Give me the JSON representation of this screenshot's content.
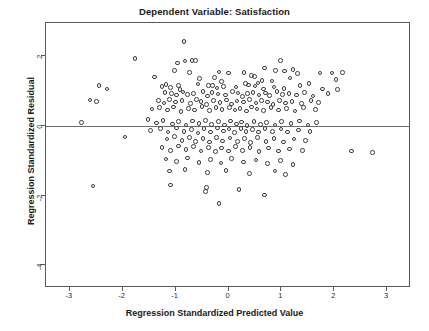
{
  "chart_data": {
    "type": "scatter",
    "title": "Dependent Variable: Satisfaction",
    "xlabel": "Regression Standardized Predicted Value",
    "ylabel": "Regression Standardized Residual",
    "xlim": [
      -3.45,
      3.45
    ],
    "ylim": [
      -4.65,
      2.95
    ],
    "xticks": [
      -3,
      -2,
      -1,
      0,
      1,
      2,
      3
    ],
    "xticklabels": [
      "-3",
      "-2",
      "-1",
      "0",
      "1",
      "2",
      "3"
    ],
    "yticks": [
      2,
      0,
      -2,
      -4
    ],
    "yticklabels": [
      "2",
      "0",
      "-2",
      "-4"
    ],
    "grid": false,
    "legend": null,
    "marker": "open-circle",
    "marker_color": "#3c3c3c",
    "frame_color": "#5a5a5a",
    "reference_lines": [
      {
        "orientation": "horizontal",
        "value": 0,
        "color": "#6e6e6e"
      }
    ],
    "n_points": 232,
    "points": [
      [
        -0.84,
        2.42
      ],
      [
        -1.77,
        1.93
      ],
      [
        -0.96,
        1.8
      ],
      [
        -0.82,
        1.86
      ],
      [
        -0.69,
        1.87
      ],
      [
        -0.62,
        1.88
      ],
      [
        0.98,
        1.87
      ],
      [
        -1.02,
        1.58
      ],
      [
        -0.74,
        1.53
      ],
      [
        -0.18,
        1.55
      ],
      [
        0.0,
        1.52
      ],
      [
        0.29,
        1.53
      ],
      [
        0.68,
        1.66
      ],
      [
        0.89,
        1.59
      ],
      [
        1.06,
        1.57
      ],
      [
        1.22,
        1.61
      ],
      [
        1.3,
        1.5
      ],
      [
        1.73,
        1.52
      ],
      [
        1.96,
        1.52
      ],
      [
        2.15,
        1.53
      ],
      [
        -1.4,
        1.4
      ],
      [
        -0.55,
        1.35
      ],
      [
        -0.26,
        1.39
      ],
      [
        -0.13,
        1.28
      ],
      [
        0.44,
        1.44
      ],
      [
        0.49,
        1.41
      ],
      [
        0.63,
        1.3
      ],
      [
        0.82,
        1.29
      ],
      [
        1.16,
        1.37
      ],
      [
        2.03,
        1.33
      ],
      [
        -2.45,
        1.15
      ],
      [
        -2.3,
        1.06
      ],
      [
        -1.26,
        1.13
      ],
      [
        -1.18,
        1.18
      ],
      [
        -1.1,
        1.1
      ],
      [
        -0.95,
        1.16
      ],
      [
        -0.92,
        1.05
      ],
      [
        -0.58,
        1.2
      ],
      [
        -0.38,
        1.16
      ],
      [
        -0.3,
        1.15
      ],
      [
        -0.22,
        1.09
      ],
      [
        -0.09,
        1.13
      ],
      [
        0.14,
        1.12
      ],
      [
        0.32,
        1.21
      ],
      [
        0.38,
        1.17
      ],
      [
        0.5,
        1.14
      ],
      [
        0.56,
        1.23
      ],
      [
        0.66,
        1.06
      ],
      [
        0.86,
        1.12
      ],
      [
        1.05,
        1.08
      ],
      [
        1.35,
        1.16
      ],
      [
        1.52,
        1.22
      ],
      [
        1.78,
        1.06
      ],
      [
        2.06,
        1.05
      ],
      [
        -1.2,
        0.95
      ],
      [
        -1.08,
        0.92
      ],
      [
        -0.98,
        0.88
      ],
      [
        -0.86,
        0.97
      ],
      [
        -0.78,
        0.9
      ],
      [
        -0.66,
        0.93
      ],
      [
        -0.48,
        0.98
      ],
      [
        -0.4,
        0.86
      ],
      [
        -0.31,
        0.96
      ],
      [
        -0.2,
        0.91
      ],
      [
        -0.06,
        0.88
      ],
      [
        0.08,
        0.99
      ],
      [
        0.18,
        0.94
      ],
      [
        0.26,
        0.85
      ],
      [
        0.36,
        0.92
      ],
      [
        0.46,
        0.96
      ],
      [
        0.58,
        0.89
      ],
      [
        0.7,
        0.94
      ],
      [
        0.78,
        0.87
      ],
      [
        0.92,
        0.98
      ],
      [
        1.02,
        0.9
      ],
      [
        1.14,
        0.93
      ],
      [
        1.28,
        0.88
      ],
      [
        1.44,
        0.95
      ],
      [
        1.6,
        0.86
      ],
      [
        1.88,
        0.92
      ],
      [
        -2.62,
        0.74
      ],
      [
        -2.5,
        0.7
      ],
      [
        -1.32,
        0.72
      ],
      [
        -1.22,
        0.66
      ],
      [
        -1.12,
        0.75
      ],
      [
        -1.0,
        0.68
      ],
      [
        -0.88,
        0.73
      ],
      [
        -0.72,
        0.64
      ],
      [
        -0.6,
        0.76
      ],
      [
        -0.52,
        0.7
      ],
      [
        -0.42,
        0.62
      ],
      [
        -0.28,
        0.72
      ],
      [
        -0.16,
        0.67
      ],
      [
        -0.04,
        0.74
      ],
      [
        0.06,
        0.63
      ],
      [
        0.16,
        0.71
      ],
      [
        0.28,
        0.68
      ],
      [
        0.4,
        0.76
      ],
      [
        0.52,
        0.65
      ],
      [
        0.62,
        0.72
      ],
      [
        0.74,
        0.69
      ],
      [
        0.84,
        0.62
      ],
      [
        0.96,
        0.73
      ],
      [
        1.08,
        0.66
      ],
      [
        1.2,
        0.7
      ],
      [
        1.38,
        0.64
      ],
      [
        1.56,
        0.72
      ],
      [
        1.7,
        0.67
      ],
      [
        -1.45,
        0.48
      ],
      [
        -1.3,
        0.52
      ],
      [
        -1.15,
        0.45
      ],
      [
        -1.04,
        0.54
      ],
      [
        -0.9,
        0.42
      ],
      [
        -0.76,
        0.5
      ],
      [
        -0.64,
        0.46
      ],
      [
        -0.5,
        0.55
      ],
      [
        -0.36,
        0.44
      ],
      [
        -0.24,
        0.52
      ],
      [
        -0.12,
        0.47
      ],
      [
        0.02,
        0.53
      ],
      [
        0.12,
        0.45
      ],
      [
        0.22,
        0.5
      ],
      [
        0.34,
        0.43
      ],
      [
        0.44,
        0.54
      ],
      [
        0.54,
        0.48
      ],
      [
        0.66,
        0.44
      ],
      [
        0.8,
        0.52
      ],
      [
        0.94,
        0.46
      ],
      [
        1.1,
        0.5
      ],
      [
        1.26,
        0.43
      ],
      [
        1.42,
        0.52
      ],
      [
        1.64,
        0.47
      ],
      [
        -2.78,
        0.1
      ],
      [
        -1.52,
        0.18
      ],
      [
        -1.36,
        0.08
      ],
      [
        -1.24,
        0.15
      ],
      [
        -1.06,
        0.05
      ],
      [
        -0.94,
        0.12
      ],
      [
        -0.8,
        0.02
      ],
      [
        -0.68,
        0.14
      ],
      [
        -0.56,
        0.06
      ],
      [
        -0.44,
        0.16
      ],
      [
        -0.32,
        0.04
      ],
      [
        -0.19,
        0.12
      ],
      [
        -0.08,
        0.02
      ],
      [
        0.04,
        0.14
      ],
      [
        0.15,
        0.05
      ],
      [
        0.25,
        0.11
      ],
      [
        0.35,
        0.01
      ],
      [
        0.48,
        0.13
      ],
      [
        0.6,
        0.04
      ],
      [
        0.72,
        0.1
      ],
      [
        0.88,
        0.02
      ],
      [
        1.0,
        0.12
      ],
      [
        1.18,
        0.06
      ],
      [
        1.34,
        0.14
      ],
      [
        1.5,
        0.03
      ],
      [
        1.66,
        0.1
      ],
      [
        -1.48,
        -0.14
      ],
      [
        -1.28,
        -0.08
      ],
      [
        -1.14,
        -0.18
      ],
      [
        -0.98,
        -0.06
      ],
      [
        -0.84,
        -0.16
      ],
      [
        -0.7,
        -0.1
      ],
      [
        -0.58,
        -0.2
      ],
      [
        -0.46,
        -0.08
      ],
      [
        -0.34,
        -0.18
      ],
      [
        -0.21,
        -0.06
      ],
      [
        -0.1,
        -0.15
      ],
      [
        0.01,
        -0.09
      ],
      [
        0.11,
        -0.19
      ],
      [
        0.24,
        -0.07
      ],
      [
        0.33,
        -0.16
      ],
      [
        0.45,
        -0.1
      ],
      [
        0.57,
        -0.18
      ],
      [
        0.69,
        -0.08
      ],
      [
        0.83,
        -0.16
      ],
      [
        0.99,
        -0.09
      ],
      [
        1.12,
        -0.18
      ],
      [
        1.32,
        -0.12
      ],
      [
        1.54,
        -0.16
      ],
      [
        -1.96,
        -0.32
      ],
      [
        -1.16,
        -0.38
      ],
      [
        -1.02,
        -0.3
      ],
      [
        -0.88,
        -0.42
      ],
      [
        -0.74,
        -0.34
      ],
      [
        -0.62,
        -0.44
      ],
      [
        -0.48,
        -0.36
      ],
      [
        -0.36,
        -0.46
      ],
      [
        -0.23,
        -0.33
      ],
      [
        -0.11,
        -0.43
      ],
      [
        0.03,
        -0.35
      ],
      [
        0.17,
        -0.45
      ],
      [
        0.3,
        -0.37
      ],
      [
        0.42,
        -0.47
      ],
      [
        0.55,
        -0.34
      ],
      [
        0.71,
        -0.44
      ],
      [
        0.86,
        -0.36
      ],
      [
        1.04,
        -0.46
      ],
      [
        1.24,
        -0.38
      ],
      [
        1.46,
        -0.42
      ],
      [
        -1.26,
        -0.62
      ],
      [
        -1.1,
        -0.7
      ],
      [
        -0.94,
        -0.58
      ],
      [
        -0.8,
        -0.68
      ],
      [
        -0.66,
        -0.6
      ],
      [
        -0.52,
        -0.72
      ],
      [
        -0.38,
        -0.62
      ],
      [
        -0.25,
        -0.74
      ],
      [
        -0.13,
        -0.64
      ],
      [
        0.0,
        -0.72
      ],
      [
        0.13,
        -0.6
      ],
      [
        0.27,
        -0.7
      ],
      [
        0.41,
        -0.62
      ],
      [
        0.58,
        -0.74
      ],
      [
        0.76,
        -0.64
      ],
      [
        0.95,
        -0.72
      ],
      [
        1.15,
        -0.66
      ],
      [
        1.4,
        -0.7
      ],
      [
        2.32,
        -0.72
      ],
      [
        2.72,
        -0.76
      ],
      [
        -1.18,
        -0.95
      ],
      [
        -0.98,
        -1.02
      ],
      [
        -0.78,
        -0.92
      ],
      [
        -0.56,
        -1.05
      ],
      [
        -0.34,
        -0.96
      ],
      [
        -0.14,
        -1.06
      ],
      [
        0.06,
        -0.94
      ],
      [
        0.28,
        -1.04
      ],
      [
        0.52,
        -0.98
      ],
      [
        0.74,
        -1.08
      ],
      [
        0.98,
        -1.0
      ],
      [
        1.22,
        -1.1
      ],
      [
        -1.12,
        -1.3
      ],
      [
        -0.82,
        -1.26
      ],
      [
        -0.4,
        -1.34
      ],
      [
        -0.05,
        -1.28
      ],
      [
        0.4,
        -1.36
      ],
      [
        0.88,
        -1.3
      ],
      [
        1.08,
        -1.4
      ],
      [
        -2.56,
        -1.72
      ],
      [
        -1.1,
        -1.7
      ],
      [
        -0.42,
        -1.76
      ],
      [
        -0.44,
        -1.88
      ],
      [
        0.2,
        -1.82
      ],
      [
        0.68,
        -1.98
      ],
      [
        -0.18,
        -2.22
      ]
    ]
  }
}
